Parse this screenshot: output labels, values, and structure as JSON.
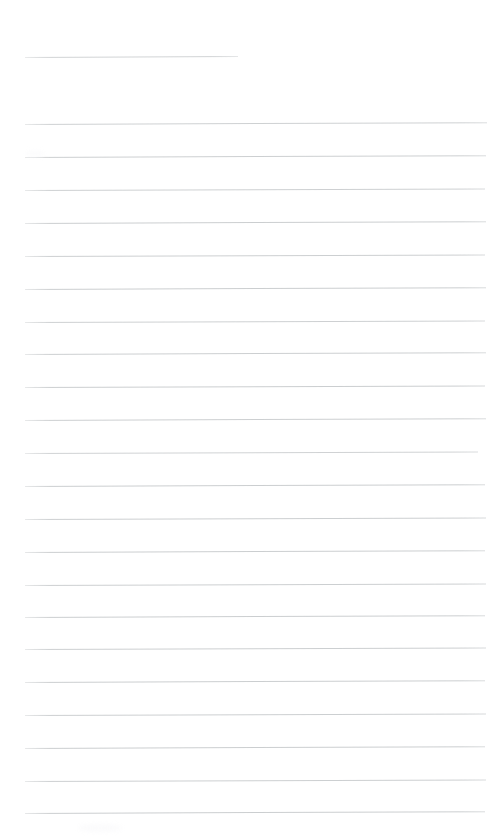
{
  "document": {
    "kind": "blank-ruled-sheet",
    "page_width": 493,
    "page_height": 839,
    "background_color": "#ffffff",
    "rule_color": "#c6c9cb",
    "rule_thickness_px": 1,
    "rule_spacing_px": 33,
    "left_margin_px": 25,
    "right_edge_px": 486,
    "text_content": "",
    "heading_text": "",
    "has_vertical_margin_rule": false,
    "total_rules": 23
  },
  "rules": [
    {
      "name": "heading-rule",
      "x": 25,
      "y": 57,
      "width": 213,
      "slant": -0.3,
      "opacity": 0.8
    },
    {
      "name": "body-rule-1",
      "x": 25,
      "y": 124,
      "width": 462,
      "slant": -0.22,
      "opacity": 0.85
    },
    {
      "name": "body-rule-2",
      "x": 25,
      "y": 157,
      "width": 461,
      "slant": -0.22,
      "opacity": 0.88
    },
    {
      "name": "body-rule-3",
      "x": 25,
      "y": 190,
      "width": 460,
      "slant": -0.2,
      "opacity": 0.86
    },
    {
      "name": "body-rule-4",
      "x": 25,
      "y": 223,
      "width": 461,
      "slant": -0.22,
      "opacity": 0.9
    },
    {
      "name": "body-rule-5",
      "x": 25,
      "y": 256,
      "width": 460,
      "slant": -0.2,
      "opacity": 0.88
    },
    {
      "name": "body-rule-6",
      "x": 25,
      "y": 289,
      "width": 461,
      "slant": -0.22,
      "opacity": 0.9
    },
    {
      "name": "body-rule-7",
      "x": 25,
      "y": 322,
      "width": 460,
      "slant": -0.2,
      "opacity": 0.86
    },
    {
      "name": "body-rule-8",
      "x": 25,
      "y": 354,
      "width": 461,
      "slant": -0.22,
      "opacity": 0.88
    },
    {
      "name": "body-rule-9",
      "x": 25,
      "y": 387,
      "width": 460,
      "slant": -0.2,
      "opacity": 0.9
    },
    {
      "name": "body-rule-10",
      "x": 25,
      "y": 420,
      "width": 461,
      "slant": -0.22,
      "opacity": 0.88
    },
    {
      "name": "body-rule-11",
      "x": 25,
      "y": 453,
      "width": 453,
      "slant": -0.2,
      "opacity": 0.82
    },
    {
      "name": "body-rule-12",
      "x": 25,
      "y": 486,
      "width": 460,
      "slant": -0.22,
      "opacity": 0.9
    },
    {
      "name": "body-rule-13",
      "x": 25,
      "y": 519,
      "width": 461,
      "slant": -0.2,
      "opacity": 0.88
    },
    {
      "name": "body-rule-14",
      "x": 25,
      "y": 552,
      "width": 460,
      "slant": -0.22,
      "opacity": 0.9
    },
    {
      "name": "body-rule-15",
      "x": 25,
      "y": 585,
      "width": 461,
      "slant": -0.2,
      "opacity": 0.88
    },
    {
      "name": "body-rule-16",
      "x": 25,
      "y": 617,
      "width": 460,
      "slant": -0.22,
      "opacity": 0.9
    },
    {
      "name": "body-rule-17",
      "x": 25,
      "y": 649,
      "width": 461,
      "slant": -0.2,
      "opacity": 0.88
    },
    {
      "name": "body-rule-18",
      "x": 25,
      "y": 682,
      "width": 460,
      "slant": -0.22,
      "opacity": 0.9
    },
    {
      "name": "body-rule-19",
      "x": 25,
      "y": 715,
      "width": 461,
      "slant": -0.2,
      "opacity": 0.88
    },
    {
      "name": "body-rule-20",
      "x": 25,
      "y": 748,
      "width": 460,
      "slant": -0.22,
      "opacity": 0.9
    },
    {
      "name": "body-rule-21",
      "x": 25,
      "y": 781,
      "width": 461,
      "slant": -0.2,
      "opacity": 0.88
    },
    {
      "name": "body-rule-22",
      "x": 25,
      "y": 813,
      "width": 460,
      "slant": -0.22,
      "opacity": 0.9
    }
  ],
  "artifacts": [
    {
      "name": "scan-smudge-bottom-left",
      "x": 78,
      "y": 824,
      "width": 44,
      "height": 8
    },
    {
      "name": "scan-smudge-upper-left",
      "x": 26,
      "y": 151,
      "width": 18,
      "height": 5
    }
  ]
}
